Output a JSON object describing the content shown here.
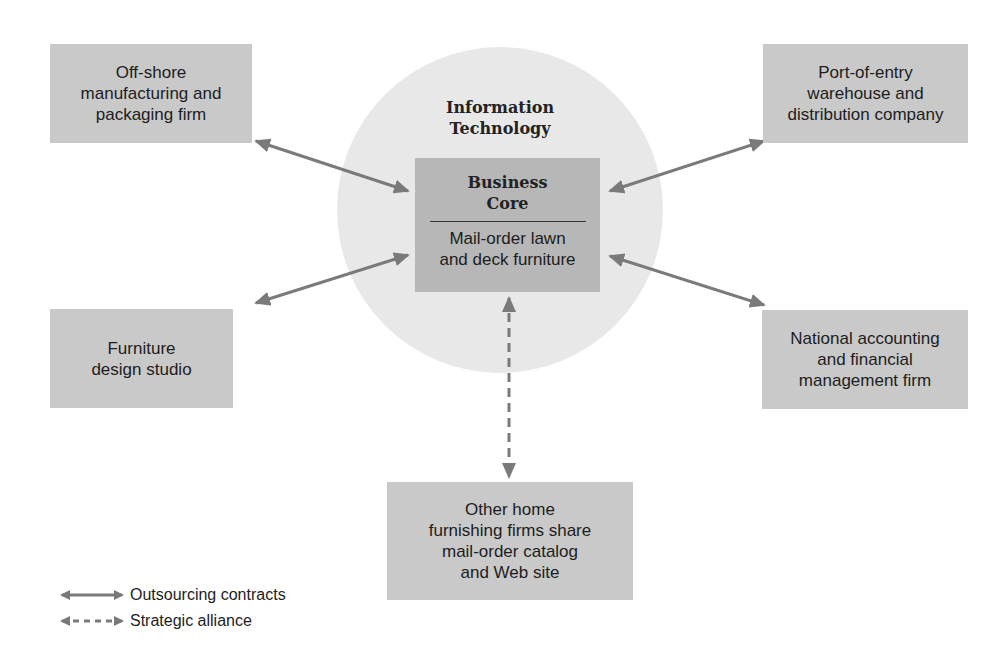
{
  "diagram": {
    "center": {
      "circle_label_line1": "Information",
      "circle_label_line2": "Technology",
      "core_title_line1": "Business",
      "core_title_line2": "Core",
      "core_desc_line1": "Mail-order lawn",
      "core_desc_line2": "and deck furniture"
    },
    "nodes": {
      "top_left": {
        "lines": [
          "Off-shore",
          "manufacturing and",
          "packaging firm"
        ],
        "relation": "Outsourcing contracts"
      },
      "top_right": {
        "lines": [
          "Port-of-entry",
          "warehouse and",
          "distribution company"
        ],
        "relation": "Outsourcing contracts"
      },
      "mid_left": {
        "lines": [
          "Furniture",
          "design studio"
        ],
        "relation": "Outsourcing contracts"
      },
      "mid_right": {
        "lines": [
          "National accounting",
          "and financial",
          "management firm"
        ],
        "relation": "Outsourcing contracts"
      },
      "bottom": {
        "lines": [
          "Other home",
          "furnishing firms share",
          "mail-order catalog",
          "and Web site"
        ],
        "relation": "Strategic alliance"
      }
    },
    "legend": {
      "solid_label": "Outsourcing contracts",
      "dashed_label": "Strategic alliance"
    },
    "colors": {
      "circle_fill": "#e8e8e8",
      "node_fill": "#c9c9c9",
      "core_fill": "#b7b7b7",
      "arrow": "#7a7a7a",
      "text": "#1d1d1d"
    }
  }
}
